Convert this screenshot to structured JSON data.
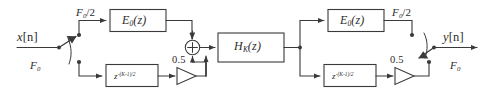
{
  "figure": {
    "type": "block-diagram",
    "stroke_color": "#3a3a3a",
    "text_color": "#2b2b2b",
    "background": "#ffffff"
  },
  "signals": {
    "input": {
      "base": "x",
      "index": "[n]",
      "text": "x[n]"
    },
    "output": {
      "base": "y",
      "index": "[n]",
      "text": "y[n]"
    }
  },
  "rates": {
    "full": {
      "base": "F",
      "sub": "0",
      "text": "F0"
    },
    "half": {
      "base": "F",
      "sub": "0",
      "suffix": "/2",
      "text": "F0/2"
    }
  },
  "blocks": {
    "polyphase_left": {
      "base": "E",
      "sub": "0",
      "arg": "(z)",
      "text": "E0(z)"
    },
    "polyphase_right": {
      "base": "E",
      "sub": "0",
      "arg": "(z)",
      "text": "E0(z)"
    },
    "delay_left": {
      "base": "z",
      "exp": "-(K-1)/2",
      "text": "z^-(K-1)/2"
    },
    "delay_right": {
      "base": "z",
      "exp": "-(K-1)/2",
      "text": "z^-(K-1)/2"
    },
    "filter_center": {
      "base": "H",
      "sub": "K",
      "arg": "(z)",
      "text": "HK(z)"
    }
  },
  "gains": {
    "left": {
      "value": "0.5"
    },
    "right": {
      "value": "0.5"
    }
  },
  "adder": {
    "symbol": "+",
    "name": "summing-junction"
  },
  "commutators": {
    "input": {
      "name": "input-commutator",
      "positions": 2
    },
    "output": {
      "name": "output-commutator",
      "positions": 2
    }
  }
}
